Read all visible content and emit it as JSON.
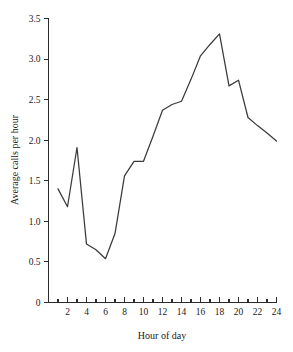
{
  "chart_data": {
    "type": "line",
    "title": "",
    "xlabel": "Hour of day",
    "ylabel": "Average calls per hour",
    "x": [
      1,
      2,
      3,
      4,
      5,
      6,
      7,
      8,
      9,
      10,
      11,
      12,
      13,
      14,
      15,
      16,
      17,
      18,
      19,
      20,
      21,
      22,
      23,
      24
    ],
    "values": [
      1.4,
      1.18,
      1.91,
      0.72,
      0.65,
      0.54,
      0.85,
      1.56,
      1.74,
      1.74,
      2.05,
      2.37,
      2.44,
      2.48,
      2.75,
      3.04,
      3.18,
      3.31,
      2.67,
      2.74,
      2.28,
      2.18,
      2.09,
      1.99
    ],
    "series": [
      {
        "name": "Average calls per hour",
        "values": [
          1.4,
          1.18,
          1.91,
          0.72,
          0.65,
          0.54,
          0.85,
          1.56,
          1.74,
          1.74,
          2.05,
          2.37,
          2.44,
          2.48,
          2.75,
          3.04,
          3.18,
          3.31,
          2.67,
          2.74,
          2.28,
          2.18,
          2.09,
          1.99
        ]
      }
    ],
    "xlim": [
      0,
      24
    ],
    "ylim": [
      0,
      3.5
    ],
    "grid": false,
    "legend": "none",
    "line_color": "#3a3a3a",
    "axis_color": "#2b2b2b",
    "background": "#ffffff",
    "y_ticks": [
      {
        "value": 0,
        "label": "0"
      },
      {
        "value": 0.5,
        "label": "0.5"
      },
      {
        "value": 1.0,
        "label": "1.0"
      },
      {
        "value": 1.5,
        "label": "1.5"
      },
      {
        "value": 2.0,
        "label": "2.0"
      },
      {
        "value": 2.5,
        "label": "2.5"
      },
      {
        "value": 3.0,
        "label": "3.0"
      },
      {
        "value": 3.5,
        "label": "3.5"
      }
    ],
    "x_ticks_major": [
      {
        "value": 2,
        "label": "2"
      },
      {
        "value": 4,
        "label": "4"
      },
      {
        "value": 6,
        "label": "6"
      },
      {
        "value": 8,
        "label": "8"
      },
      {
        "value": 10,
        "label": "10"
      },
      {
        "value": 12,
        "label": "12"
      },
      {
        "value": 14,
        "label": "14"
      },
      {
        "value": 16,
        "label": "16"
      },
      {
        "value": 18,
        "label": "18"
      },
      {
        "value": 20,
        "label": "20"
      },
      {
        "value": 22,
        "label": "22"
      },
      {
        "value": 24,
        "label": "24"
      }
    ],
    "x_ticks_minor": [
      1,
      3,
      5,
      7,
      9,
      11,
      13,
      15,
      17,
      19,
      21,
      23
    ]
  }
}
